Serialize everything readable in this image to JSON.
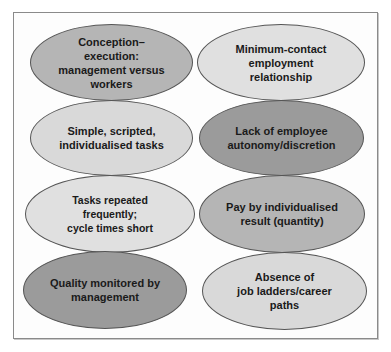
{
  "diagram": {
    "type": "ellipse-grid",
    "columns": 2,
    "rows": 4,
    "items": [
      {
        "id": "left-1",
        "label": "Conception–\nexecution:\nmanagement versus\nworkers",
        "shade": "medium",
        "color": "#b5b5b5"
      },
      {
        "id": "right-1",
        "label": "Minimum-contact\nemployment\nrelationship",
        "shade": "light",
        "color": "#e0e0e0"
      },
      {
        "id": "left-2",
        "label": "Simple, scripted,\nindividualised tasks",
        "shade": "light",
        "color": "#d9d9d9"
      },
      {
        "id": "right-2",
        "label": "Lack of employee\nautonomy/discretion",
        "shade": "dark",
        "color": "#9b9b9b"
      },
      {
        "id": "left-3",
        "label": "Tasks repeated frequently;\ncycle times short",
        "shade": "light",
        "color": "#e0e0e0"
      },
      {
        "id": "right-3",
        "label": "Pay by individualised\nresult (quantity)",
        "shade": "medium",
        "color": "#b5b5b5"
      },
      {
        "id": "left-4",
        "label": "Quality monitored by\nmanagement",
        "shade": "dark",
        "color": "#9b9b9b"
      },
      {
        "id": "right-4",
        "label": "Absence of\njob ladders/career\npaths",
        "shade": "light",
        "color": "#d9d9d9"
      }
    ]
  }
}
